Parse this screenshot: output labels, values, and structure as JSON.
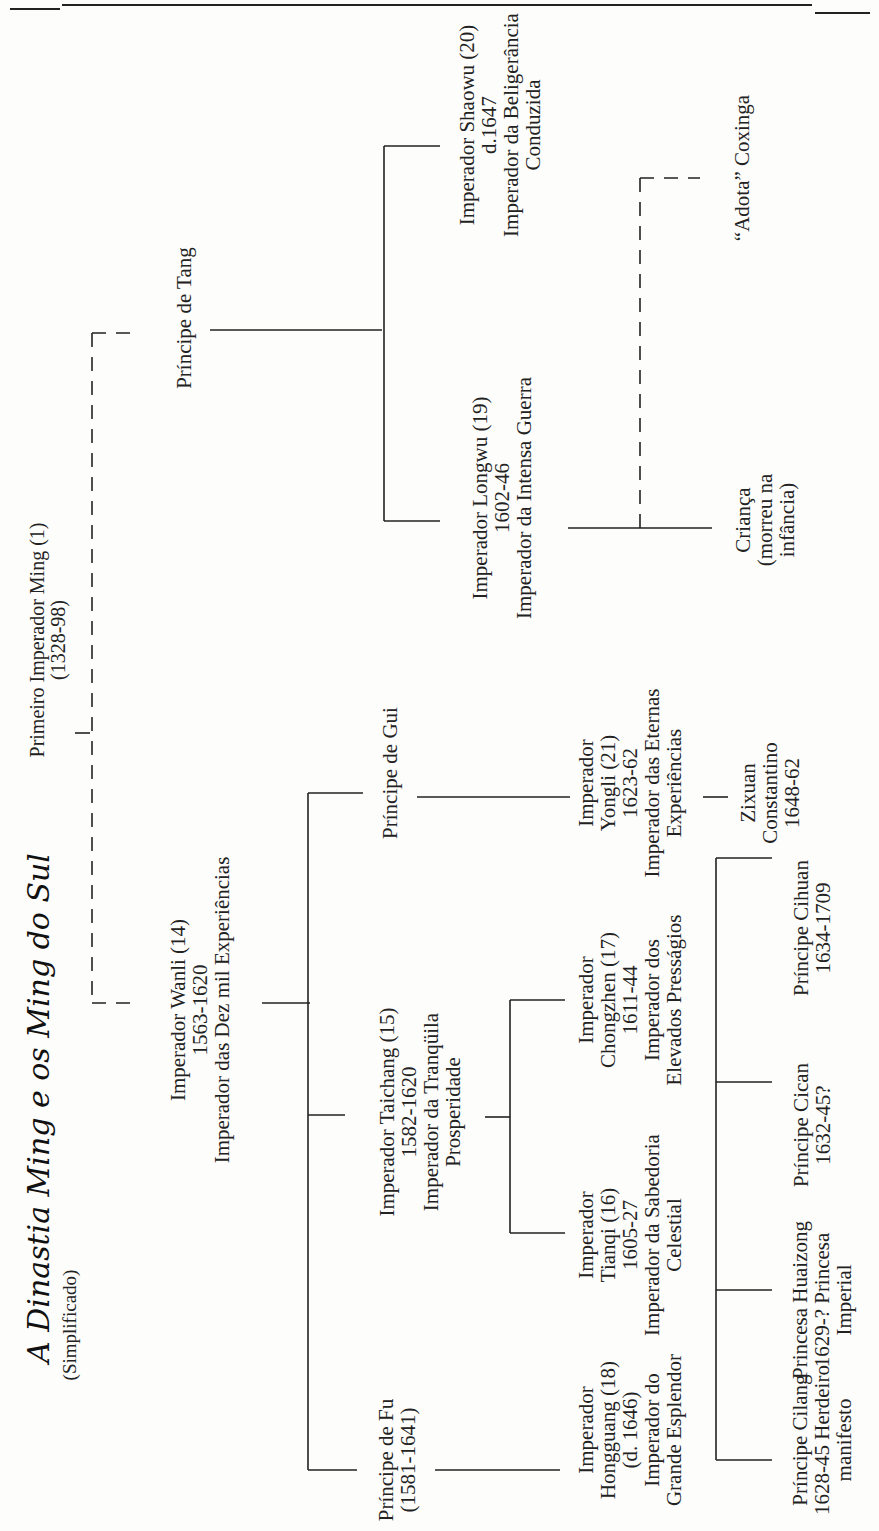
{
  "header": {
    "running_title": "Dinastia Qing e os Ming do Sul"
  },
  "title": "A Dinastia Ming e os Ming do Sul",
  "subtitle": "(Simplificado)",
  "nodes": {
    "first_emperor": {
      "lines": [
        "Primeiro Imperador Ming (1)",
        "(1328-98)"
      ]
    },
    "tang": {
      "lines": [
        "Príncipe de Tang"
      ]
    },
    "shaowu": {
      "lines": [
        "Imperador Shaowu (20)",
        "d.1647",
        "Imperador da Beligerância",
        "Conduzida"
      ]
    },
    "longwu": {
      "lines": [
        "Imperador Longwu (19)",
        "1602-46",
        "Imperador da Intensa Guerra"
      ]
    },
    "crianca": {
      "lines": [
        "Criança",
        "(morreu na",
        "infância)"
      ]
    },
    "coxinga": {
      "lines": [
        "“Adota” Coxinga"
      ]
    },
    "wanli": {
      "lines": [
        "Imperador Wanli (14)",
        "1563-1620",
        "Imperador das Dez mil Experiências"
      ]
    },
    "gui": {
      "lines": [
        "Príncipe de Gui"
      ]
    },
    "yongli": {
      "lines": [
        "Imperador",
        "Yongli (21)",
        "1623-62",
        "Imperador das Eternas",
        "Experiências"
      ]
    },
    "zixuan": {
      "lines": [
        "Zixuan",
        "Constantino",
        "1648-62"
      ]
    },
    "taichang": {
      "lines": [
        "Imperador Taichang (15)",
        "1582-1620",
        "Imperador da Tranqüila",
        "Prosperidade"
      ]
    },
    "chongzhen": {
      "lines": [
        "Imperador",
        "Chongzhen (17)",
        "1611-44",
        "Imperador dos",
        "Elevados Presságios"
      ]
    },
    "tianqi": {
      "lines": [
        "Imperador",
        "Tianqi (16)",
        "1605-27",
        "Imperador da Sabedoria",
        "Celestial"
      ]
    },
    "fu": {
      "lines": [
        "Príncipe de Fu",
        "(1581-1641)"
      ]
    },
    "hongguang": {
      "lines": [
        "Imperador",
        "Hongguang (18)",
        "(d. 1646)",
        "Imperador do",
        "Grande Esplendor"
      ]
    },
    "cihuan": {
      "lines": [
        "Príncipe Cihuan",
        "1634-1709"
      ]
    },
    "cican": {
      "lines": [
        "Príncipe Cican",
        "1632-45?"
      ]
    },
    "huaizong": {
      "lines": [
        "Princesa Huaizong",
        "1629-? Princesa",
        "Imperial"
      ]
    },
    "cilang": {
      "lines": [
        "Príncipe Cilang",
        "1628-45 Herdeiro",
        "manifesto"
      ]
    }
  },
  "colors": {
    "ink": "#222222",
    "paper": "#fdfdfb"
  }
}
